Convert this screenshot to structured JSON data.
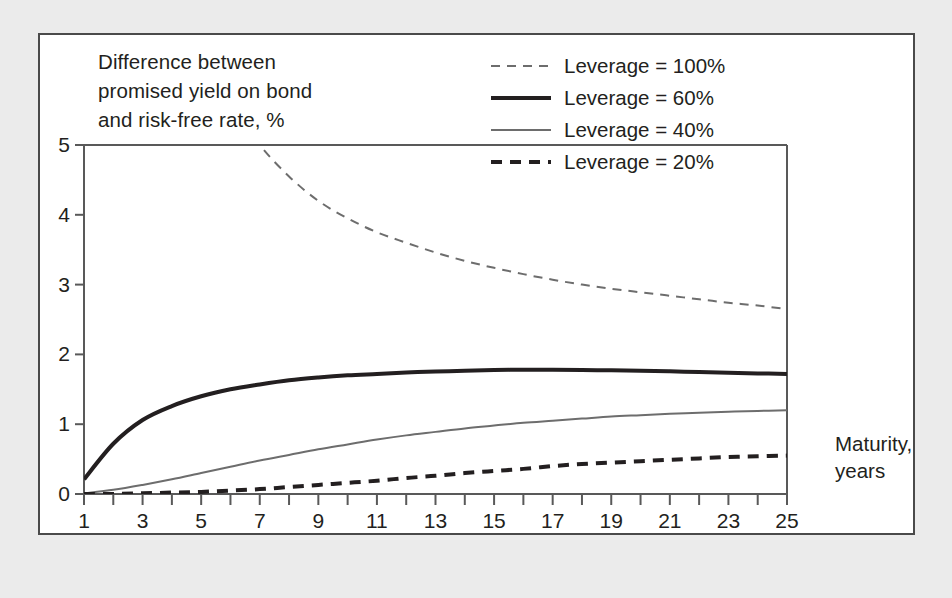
{
  "figure": {
    "y_axis_title": "Difference between\npromised yield on bond\nand risk-free rate, %",
    "x_axis_title": "Maturity,\nyears"
  },
  "legend": {
    "position": "inside-top-right",
    "entries": [
      {
        "label": "Leverage = 100%",
        "style": "dashed",
        "color": "#6d6d6d",
        "width": 2.0,
        "dash": "9,7"
      },
      {
        "label": "Leverage = 60%",
        "style": "solid",
        "color": "#231f20",
        "width": 4.0,
        "dash": ""
      },
      {
        "label": "Leverage = 40%",
        "style": "solid",
        "color": "#6d6d6d",
        "width": 2.0,
        "dash": ""
      },
      {
        "label": "Leverage = 20%",
        "style": "dashed",
        "color": "#231f20",
        "width": 4.0,
        "dash": "11,8"
      }
    ]
  },
  "chart_data": {
    "type": "line",
    "title": "",
    "xlabel": "Maturity, years",
    "ylabel": "Difference between promised yield on bond and risk-free rate, %",
    "xlim": [
      1,
      25
    ],
    "ylim": [
      0,
      5
    ],
    "grid": false,
    "x_tick_step": 1,
    "x_tick_labels": [
      "1",
      "3",
      "5",
      "7",
      "9",
      "11",
      "13",
      "15",
      "17",
      "19",
      "21",
      "23",
      "25"
    ],
    "x_tick_label_values": [
      1,
      3,
      5,
      7,
      9,
      11,
      13,
      15,
      17,
      19,
      21,
      23,
      25
    ],
    "y_tick_labels": [
      "0",
      "1",
      "2",
      "3",
      "4",
      "5"
    ],
    "y_tick_values": [
      0,
      1,
      2,
      3,
      4,
      5
    ],
    "x": [
      1,
      2,
      3,
      4,
      5,
      6,
      7,
      8,
      9,
      10,
      11,
      12,
      13,
      14,
      15,
      16,
      17,
      18,
      19,
      20,
      21,
      22,
      23,
      24,
      25
    ],
    "series": [
      {
        "name": "Leverage = 100%",
        "values": [
          18.5,
          12.6,
          9.6,
          7.8,
          6.5,
          5.6,
          5.0,
          4.55,
          4.2,
          3.95,
          3.75,
          3.6,
          3.46,
          3.34,
          3.24,
          3.15,
          3.07,
          3.0,
          2.94,
          2.89,
          2.84,
          2.79,
          2.74,
          2.7,
          2.65
        ],
        "clipped_above_ylim": true,
        "enters_plot_at_x": 5.8
      },
      {
        "name": "Leverage = 60%",
        "values": [
          0.21,
          0.72,
          1.06,
          1.26,
          1.4,
          1.5,
          1.57,
          1.63,
          1.67,
          1.7,
          1.72,
          1.74,
          1.755,
          1.765,
          1.775,
          1.78,
          1.78,
          1.777,
          1.772,
          1.765,
          1.757,
          1.748,
          1.738,
          1.728,
          1.72
        ]
      },
      {
        "name": "Leverage = 40%",
        "values": [
          0.01,
          0.06,
          0.13,
          0.21,
          0.3,
          0.39,
          0.48,
          0.56,
          0.64,
          0.71,
          0.78,
          0.84,
          0.89,
          0.94,
          0.98,
          1.02,
          1.05,
          1.08,
          1.11,
          1.13,
          1.15,
          1.165,
          1.18,
          1.19,
          1.2
        ]
      },
      {
        "name": "Leverage = 20%",
        "values": [
          0.0,
          0.0,
          0.01,
          0.02,
          0.03,
          0.05,
          0.07,
          0.1,
          0.13,
          0.16,
          0.19,
          0.23,
          0.26,
          0.3,
          0.33,
          0.36,
          0.4,
          0.43,
          0.45,
          0.47,
          0.49,
          0.51,
          0.53,
          0.54,
          0.55
        ]
      }
    ]
  },
  "colors": {
    "page_background": "#ebebeb",
    "panel_background": "#ffffff",
    "panel_border": "#4a4a4a",
    "axis": "#595959",
    "text": "#231f20",
    "series_dark": "#231f20",
    "series_gray": "#6d6d6d"
  }
}
